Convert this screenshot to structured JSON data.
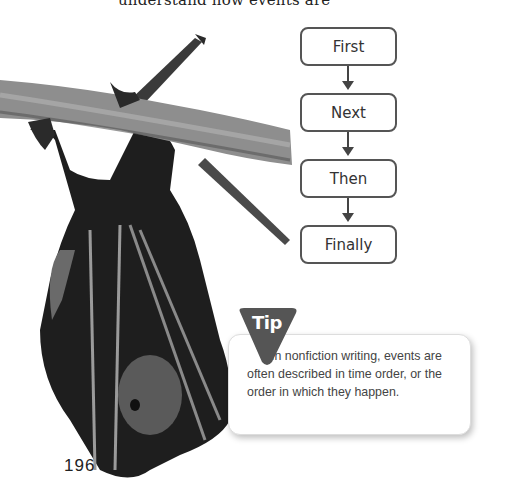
{
  "page": {
    "top_text_fragment": "understand how events are",
    "page_number": "196"
  },
  "image": {
    "subject": "bat hanging upside down from a tree branch",
    "icon": "bat-photo"
  },
  "flowchart": {
    "steps": [
      {
        "label": "First"
      },
      {
        "label": "Next"
      },
      {
        "label": "Then"
      },
      {
        "label": "Finally"
      }
    ],
    "connector": "down-arrow"
  },
  "tip": {
    "badge_label": "Tip",
    "text": "In nonfiction writing, events are often described in time order, or the order in which they happen.",
    "badge_color": "#555555"
  }
}
